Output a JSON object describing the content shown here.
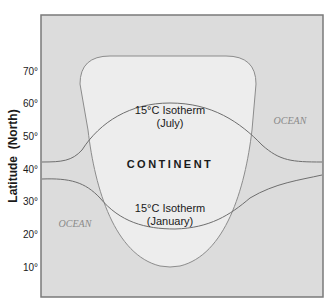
{
  "diagram": {
    "y_axis": {
      "label": "Latitude  (North)",
      "ticks": [
        {
          "label": "70°",
          "y": 71
        },
        {
          "label": "60°",
          "y": 103
        },
        {
          "label": "50°",
          "y": 136
        },
        {
          "label": "40°",
          "y": 169
        },
        {
          "label": "30°",
          "y": 201
        },
        {
          "label": "20°",
          "y": 234
        },
        {
          "label": "10°",
          "y": 267
        }
      ]
    },
    "labels": {
      "continent": "CONTINENT",
      "ocean_right": "OCEAN",
      "ocean_left": "OCEAN",
      "july_line1": "15°C Isotherm",
      "july_line2": "(July)",
      "january_line1": "15°C Isotherm",
      "january_line2": "(January)"
    },
    "colors": {
      "ocean": "#dcdcdc",
      "continent": "#ededed",
      "frame": "#7a7a7a",
      "curve": "#6e6e6e",
      "ocean_text": "#8a8a8a",
      "text": "#1a1a1a"
    }
  }
}
